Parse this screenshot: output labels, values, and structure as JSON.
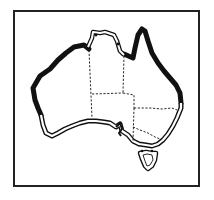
{
  "map": {
    "subject": "Australia",
    "title": "Map of Australia",
    "colors": {
      "background": "#ffffff",
      "land": "#ffffff",
      "ink": "#111111",
      "frame": "#222222"
    },
    "legend_features": {
      "thick_coast": "Thick black coastline (north, west and east coasts)",
      "double_coast": "Double-line coastline (south coast and Tasmania)",
      "state_borders": "Dashed state borders"
    },
    "regions": [
      "Western Australia",
      "Northern Territory",
      "Queensland",
      "South Australia",
      "New South Wales",
      "Victoria",
      "Tasmania"
    ],
    "markers": [
      {
        "name": "north-marker-1",
        "x": 96,
        "y": 35
      },
      {
        "name": "north-marker-2",
        "x": 118,
        "y": 44
      },
      {
        "name": "south-marker-1",
        "x": 142,
        "y": 151
      },
      {
        "name": "south-marker-2",
        "x": 152,
        "y": 151
      }
    ]
  }
}
